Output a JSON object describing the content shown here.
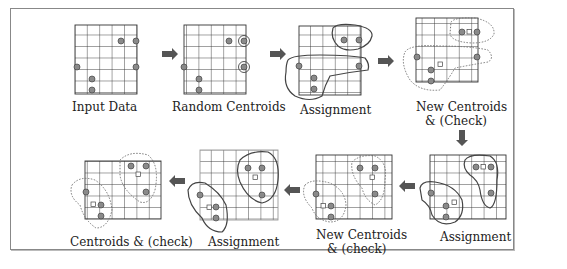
{
  "diagram": {
    "panels": [
      {
        "id": "p1",
        "label": "Input Data"
      },
      {
        "id": "p2",
        "label": "Random Centroids"
      },
      {
        "id": "p3",
        "label": "Assignment"
      },
      {
        "id": "p4",
        "label_line1": "New Centroids",
        "label_line2": "& (Check)"
      },
      {
        "id": "p5",
        "label": "Assignment"
      },
      {
        "id": "p6",
        "label_line1": "New Centroids",
        "label_line2": "& (check)"
      },
      {
        "id": "p7",
        "label": "Assignment"
      },
      {
        "id": "p8",
        "label": "Centroids & (check)"
      }
    ],
    "colors": {
      "grid": "#333333",
      "point_fill": "#888888",
      "arrow": "#555555",
      "cluster_line": "#444444"
    }
  }
}
